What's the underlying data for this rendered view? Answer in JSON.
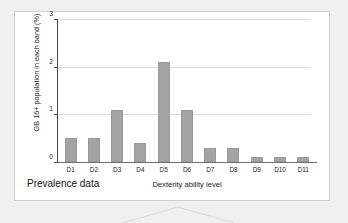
{
  "caption": "Prevalence data",
  "chart_data": {
    "type": "bar",
    "title": "",
    "subtitle": "",
    "xlabel": "Dexterity ability level",
    "ylabel": "GB 16+ population in each band (%)",
    "categories": [
      "D1",
      "D2",
      "D3",
      "D4",
      "D5",
      "D6",
      "D7",
      "D8",
      "D9",
      "D10",
      "D11"
    ],
    "values": [
      0.5,
      0.5,
      1.1,
      0.4,
      2.1,
      1.1,
      0.3,
      0.3,
      0.1,
      0.1,
      0.1
    ],
    "ylim": [
      0,
      3
    ],
    "ytick_labels": [
      "3",
      "2",
      "1",
      "0"
    ],
    "ytick_values": [
      3,
      2,
      1,
      0
    ],
    "gridlines": [
      1,
      2,
      3
    ],
    "grid": true,
    "legend": false,
    "legend_position": "none",
    "bar_color": "#a3a3a3",
    "annotations": []
  },
  "style": {
    "panel_background": "#ffffff",
    "panel_border": "#cfcfcf",
    "page_background": "#f0f0f0",
    "axis_color": "#4a4a4a",
    "gridline_color": "#dcdcdc",
    "text_color": "#1b1b1b",
    "connector_color": "#dadada"
  }
}
